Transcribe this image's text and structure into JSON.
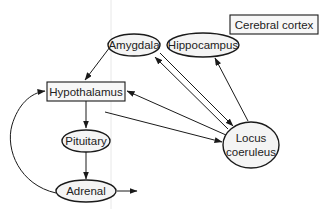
{
  "diagram": {
    "type": "flow-diagram",
    "nodes": {
      "cerebral_cortex": {
        "label": "Cerebral cortex",
        "shape": "rectangle"
      },
      "amygdala": {
        "label": "Amygdala",
        "shape": "ellipse"
      },
      "hippocampus": {
        "label": "Hippocampus",
        "shape": "ellipse"
      },
      "hypothalamus": {
        "label": "Hypothalamus",
        "shape": "rectangle"
      },
      "pituitary": {
        "label": "Pituitary",
        "shape": "ellipse"
      },
      "adrenal": {
        "label": "Adrenal",
        "shape": "ellipse"
      },
      "locus_coeruleus": {
        "label_line1": "Locus",
        "label_line2": "coeruleus",
        "shape": "ellipse"
      }
    },
    "edges": [
      {
        "from": "Amygdala",
        "to": "Hypothalamus"
      },
      {
        "from": "Hypothalamus",
        "to": "Pituitary"
      },
      {
        "from": "Pituitary",
        "to": "Adrenal"
      },
      {
        "from": "Adrenal",
        "to": "output"
      },
      {
        "from": "Adrenal",
        "to": "Hypothalamus",
        "style": "curved"
      },
      {
        "from": "Locus coeruleus",
        "to": "Hypothalamus"
      },
      {
        "from": "Hypothalamus",
        "to": "Locus coeruleus"
      },
      {
        "from": "Locus coeruleus",
        "to": "Amygdala"
      },
      {
        "from": "Amygdala",
        "to": "Locus coeruleus"
      },
      {
        "from": "Locus coeruleus",
        "to": "Hippocampus"
      }
    ],
    "colors": {
      "stroke": "#1a1a1a",
      "node_fill": "#f4f4f4",
      "text": "#222222",
      "background": "#ffffff"
    }
  }
}
